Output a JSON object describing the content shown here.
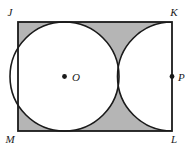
{
  "figure": {
    "type": "geometry-diagram",
    "background_color": "#ffffff",
    "shaded_color": "#b5b5b5",
    "unshaded_color": "#ffffff",
    "stroke_color": "#1a1a1a"
  },
  "rectangle": {
    "name": "JKLM",
    "x": 18,
    "y": 22,
    "width": 154,
    "height": 109,
    "vertices": [
      {
        "id": "J",
        "label": "J",
        "corner": "top-left",
        "x": 18,
        "y": 22,
        "label_x": 10,
        "label_y": 16
      },
      {
        "id": "K",
        "label": "K",
        "corner": "top-right",
        "x": 172,
        "y": 22,
        "label_x": 174,
        "label_y": 16
      },
      {
        "id": "L",
        "label": "L",
        "corner": "bottom-right",
        "x": 172,
        "y": 131,
        "label_x": 174,
        "label_y": 143
      },
      {
        "id": "M",
        "label": "M",
        "corner": "bottom-left",
        "x": 18,
        "y": 131,
        "label_x": 10,
        "label_y": 143
      }
    ]
  },
  "circles": [
    {
      "id": "circle-O",
      "center_label": "O",
      "cx": 64.5,
      "cy": 76.5,
      "r": 54.5,
      "center_dot": true,
      "center_dot_r": 2.4,
      "label_x": 72,
      "label_y": 81
    },
    {
      "id": "arc-P",
      "center_label": "P",
      "cx": 172,
      "cy": 76.5,
      "r": 54.5,
      "center_dot": true,
      "center_dot_r": 2.4,
      "label_x": 178,
      "label_y": 81
    }
  ],
  "labels": {
    "J": "J",
    "K": "K",
    "L": "L",
    "M": "M",
    "O": "O",
    "P": "P"
  }
}
